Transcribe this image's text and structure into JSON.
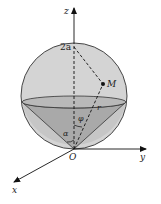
{
  "figure": {
    "type": "3d-geometry",
    "labels": {
      "z_axis": "z",
      "y_axis": "y",
      "x_axis": "x",
      "origin": "O",
      "top_point": "2a",
      "point": "M",
      "radius": "r",
      "angle_phi": "φ",
      "angle_alpha": "α"
    },
    "colors": {
      "sphere_fill": "#d4d4d4",
      "cone_fill": "#a8a8a8",
      "disk_fill": "#bdbdbd",
      "line": "#222222"
    }
  }
}
